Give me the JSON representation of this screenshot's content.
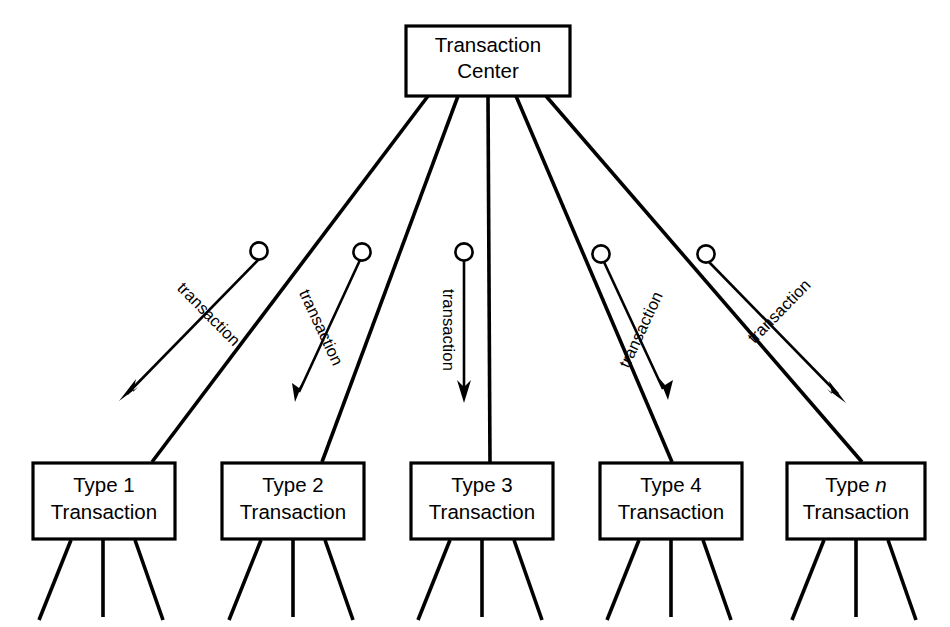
{
  "diagram": {
    "title": "Transaction Center",
    "type": "transaction-center-structure-chart",
    "center_node": {
      "line1": "Transaction",
      "line2": "Center"
    },
    "flow_label": "transaction",
    "transaction_types": [
      {
        "line1_prefix": "Type ",
        "line1_value": "1",
        "line1_italic": false,
        "line2": "Transaction"
      },
      {
        "line1_prefix": "Type ",
        "line1_value": "2",
        "line1_italic": false,
        "line2": "Transaction"
      },
      {
        "line1_prefix": "Type ",
        "line1_value": "3",
        "line1_italic": false,
        "line2": "Transaction"
      },
      {
        "line1_prefix": "Type ",
        "line1_value": "4",
        "line1_italic": false,
        "line2": "Transaction"
      },
      {
        "line1_prefix": "Type ",
        "line1_value": "n",
        "line1_italic": true,
        "line2": "Transaction"
      }
    ],
    "flow_labels": [
      "transaction",
      "transaction",
      "transaction",
      "transaction",
      "transaction"
    ],
    "colors": {
      "stroke": "#000000",
      "fill": "#ffffff",
      "background": "#ffffff"
    }
  }
}
